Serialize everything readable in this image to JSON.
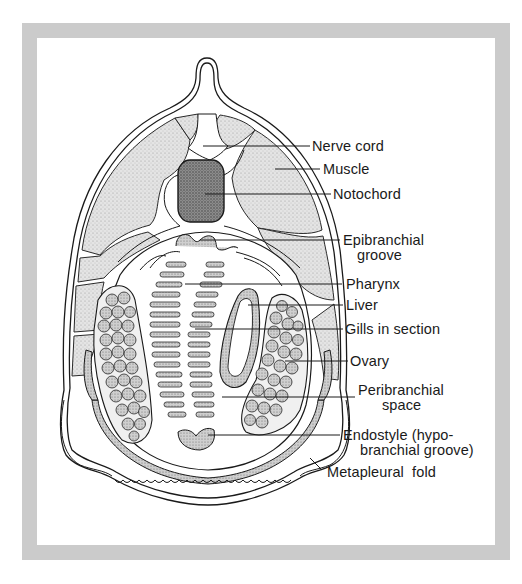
{
  "figure": {
    "border_color": "#cbcbcb",
    "ink_color": "#1a1a1a",
    "stipple_light": "#d9d9d9",
    "stipple_dark": "#8a8a8a"
  },
  "labels": [
    {
      "id": "nerve-cord",
      "lines": [
        "Nerve cord"
      ]
    },
    {
      "id": "muscle",
      "lines": [
        "Muscle"
      ]
    },
    {
      "id": "notochord",
      "lines": [
        "Notochord"
      ]
    },
    {
      "id": "epibranchial-groove",
      "lines": [
        "Epibranchial",
        "groove"
      ]
    },
    {
      "id": "pharynx",
      "lines": [
        "Pharynx"
      ]
    },
    {
      "id": "liver",
      "lines": [
        "Liver"
      ]
    },
    {
      "id": "gills-in-section",
      "lines": [
        "Gills in section"
      ]
    },
    {
      "id": "ovary",
      "lines": [
        "Ovary"
      ]
    },
    {
      "id": "peribranchial-space",
      "lines": [
        "Peribranchial",
        "space"
      ]
    },
    {
      "id": "endostyle",
      "lines": [
        "Endostyle (hypo-",
        "branchial groove)"
      ]
    },
    {
      "id": "metapleural-fold",
      "lines": [
        "Metapleural  fold"
      ]
    }
  ]
}
